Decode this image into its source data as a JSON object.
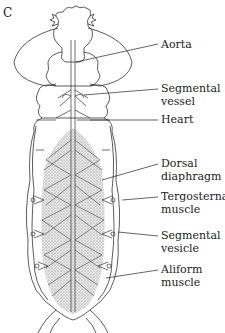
{
  "figure": {
    "panel_letter": "C",
    "labels": [
      {
        "line1": "Aorta",
        "line2": ""
      },
      {
        "line1": "Segmental",
        "line2": "vessel"
      },
      {
        "line1": "Heart",
        "line2": ""
      },
      {
        "line1": "Dorsal",
        "line2": "diaphragm"
      },
      {
        "line1": "Tergosternal",
        "line2": "muscle"
      },
      {
        "line1": "Segmental",
        "line2": "vesicle"
      },
      {
        "line1": "Aliform",
        "line2": "muscle"
      }
    ]
  }
}
